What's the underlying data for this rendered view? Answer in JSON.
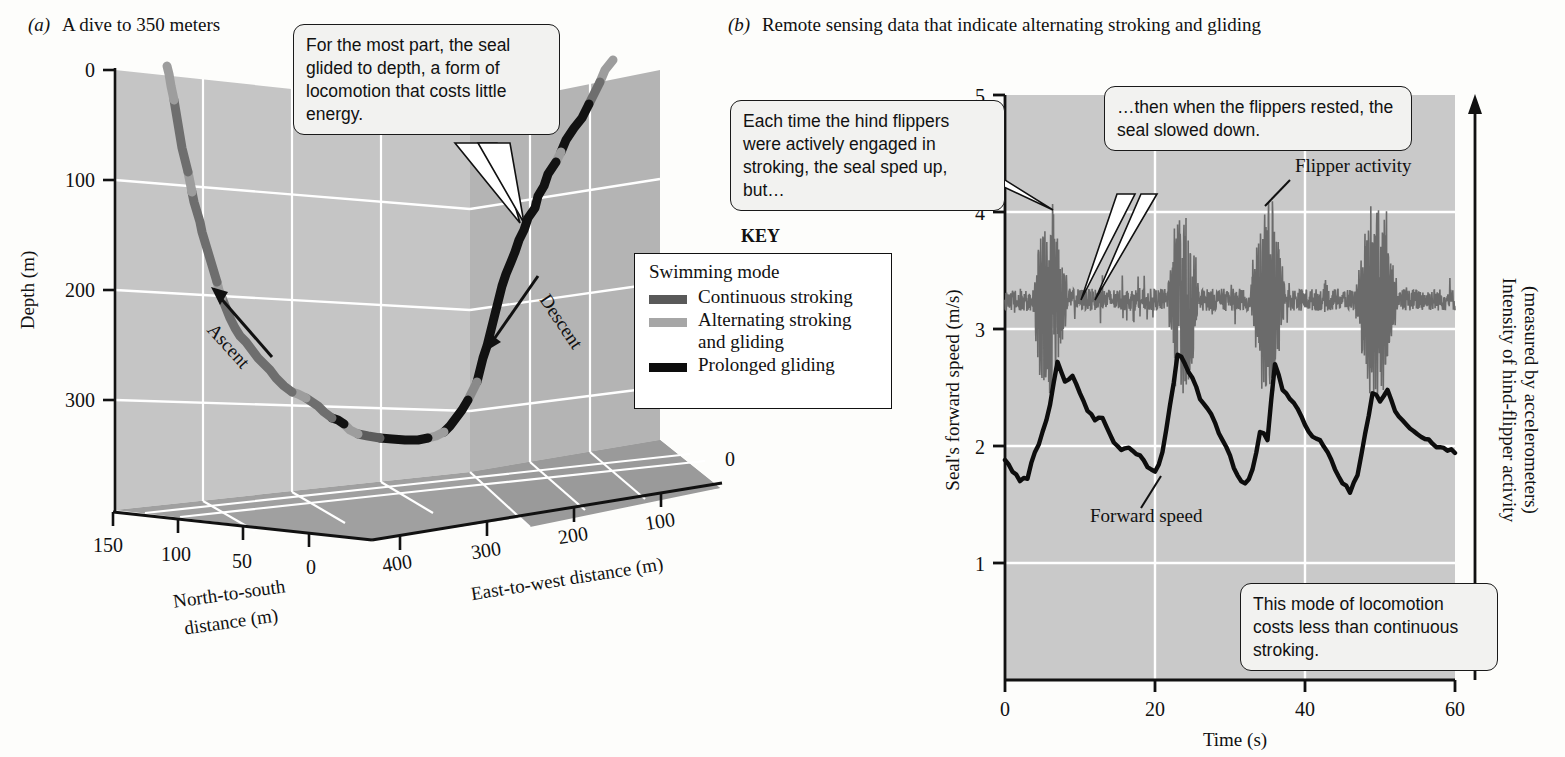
{
  "panels": {
    "a": {
      "letter": "(a)",
      "title": "A dive to 350 meters"
    },
    "b": {
      "letter": "(b)",
      "title": "Remote sensing data that indicate alternating stroking and gliding"
    }
  },
  "callouts": {
    "glide": "For the most part, the seal glided to depth, a form of locomotion that costs little energy.",
    "stroking": "Each time the hind flippers were actively engaged in stroking, the seal sped up, but…",
    "rested": "…then when the flippers rested, the seal slowed down.",
    "cheap": "This mode of locomotion costs less than continuous stroking."
  },
  "key": {
    "heading": "KEY",
    "subheading": "Swimming mode",
    "items": [
      {
        "label": "Continuous stroking",
        "color": "#595959"
      },
      {
        "label": "Alternating stroking and gliding",
        "color": "#a6a6a6"
      },
      {
        "label": "Prolonged gliding",
        "color": "#0d0d0d"
      }
    ]
  },
  "annotations": {
    "ascent": "Ascent",
    "descent": "Descent",
    "flipper_activity": "Flipper activity",
    "forward_speed": "Forward speed"
  },
  "colors": {
    "wall_back": "#c3c3c3",
    "wall_side": "#b3b3b3",
    "floor": "#9e9e9e",
    "plot_bg": "#c9c9c9",
    "grid": "#ffffff",
    "axis": "#111111",
    "speed_trace": "#0d0d0d",
    "flipper_trace": "#6b6b6b"
  },
  "chart_data": [
    {
      "type": "line",
      "id": "dive-profile-3d",
      "title": "A dive to 350 meters",
      "projection": "3d",
      "grid": true,
      "axes": {
        "depth": {
          "label": "Depth (m)",
          "ticks": [
            0,
            100,
            200,
            300
          ],
          "lim": [
            0,
            400
          ],
          "inverted": true
        },
        "north_south": {
          "label": "North-to-south distance (m)",
          "ticks": [
            150,
            100,
            50,
            0
          ],
          "lim": [
            0,
            150
          ]
        },
        "east_west": {
          "label": "East-to-west distance (m)",
          "ticks": [
            400,
            300,
            200,
            100,
            0
          ],
          "lim": [
            0,
            400
          ]
        }
      },
      "series": [
        {
          "name": "Descent",
          "mode_sequence": [
            "Alternating stroking and gliding",
            "Prolonged gliding",
            "Alternating stroking and gliding"
          ],
          "points": [
            {
              "depth": 25,
              "mode": "alternating"
            },
            {
              "depth": 45,
              "mode": "alternating"
            },
            {
              "depth": 70,
              "mode": "prolonged"
            },
            {
              "depth": 110,
              "mode": "prolonged"
            },
            {
              "depth": 150,
              "mode": "prolonged"
            },
            {
              "depth": 190,
              "mode": "prolonged"
            },
            {
              "depth": 230,
              "mode": "prolonged"
            },
            {
              "depth": 270,
              "mode": "prolonged"
            },
            {
              "depth": 300,
              "mode": "alternating"
            },
            {
              "depth": 320,
              "mode": "prolonged"
            }
          ]
        },
        {
          "name": "Bottom",
          "mode_sequence": [
            "Prolonged gliding",
            "Continuous stroking"
          ],
          "points": [
            {
              "depth": 325,
              "mode": "prolonged"
            },
            {
              "depth": 325,
              "mode": "continuous"
            },
            {
              "depth": 318,
              "mode": "alternating"
            }
          ]
        },
        {
          "name": "Ascent",
          "mode_sequence": [
            "Continuous stroking",
            "Alternating stroking and gliding"
          ],
          "points": [
            {
              "depth": 300,
              "mode": "continuous"
            },
            {
              "depth": 260,
              "mode": "continuous"
            },
            {
              "depth": 220,
              "mode": "continuous"
            },
            {
              "depth": 180,
              "mode": "continuous"
            },
            {
              "depth": 140,
              "mode": "continuous"
            },
            {
              "depth": 100,
              "mode": "continuous"
            },
            {
              "depth": 60,
              "mode": "continuous"
            },
            {
              "depth": 20,
              "mode": "alternating"
            },
            {
              "depth": 5,
              "mode": "alternating"
            }
          ]
        }
      ]
    },
    {
      "type": "line",
      "id": "speed-and-flipper-activity",
      "title": "Remote sensing data that indicate alternating stroking and gliding",
      "grid": true,
      "xlabel": "Time (s)",
      "ylabel": "Seal's forward speed (m/s)",
      "y2label": "Intensity of hind-flipper activity (measured by accelerometers)",
      "xlim": [
        0,
        60
      ],
      "ylim": [
        0,
        5
      ],
      "xticks": [
        0,
        20,
        40,
        60
      ],
      "yticks": [
        1,
        2,
        3,
        4,
        5
      ],
      "series": [
        {
          "name": "Flipper activity",
          "color": "#6b6b6b",
          "note": "baseline ~3.25 with bursts spanning ~2.6 to ~4.1",
          "burst_windows": [
            [
              3.5,
              8.5
            ],
            [
              21.5,
              26.0
            ],
            [
              32.5,
              37.5
            ],
            [
              46.5,
              52.5
            ]
          ],
          "baseline": 3.25,
          "burst_peak": 4.1,
          "burst_trough": 2.6
        },
        {
          "name": "Forward speed",
          "color": "#0d0d0d",
          "x": [
            0,
            1,
            2,
            3,
            4,
            5,
            6,
            7,
            8,
            9,
            10,
            11,
            12,
            13,
            14,
            15,
            16,
            17,
            18,
            19,
            20,
            21,
            22,
            23,
            24,
            25,
            26,
            27,
            28,
            29,
            30,
            31,
            32,
            33,
            34,
            35,
            36,
            37,
            38,
            39,
            40,
            41,
            42,
            43,
            44,
            45,
            46,
            47,
            48,
            49,
            50,
            51,
            52,
            53,
            54,
            55,
            56,
            57,
            58,
            59,
            60
          ],
          "y": [
            1.88,
            1.78,
            1.7,
            1.72,
            1.95,
            2.12,
            2.35,
            2.72,
            2.55,
            2.6,
            2.45,
            2.3,
            2.22,
            2.24,
            2.1,
            2.0,
            1.98,
            1.96,
            1.92,
            1.82,
            1.78,
            1.95,
            2.35,
            2.78,
            2.7,
            2.58,
            2.4,
            2.32,
            2.2,
            2.05,
            1.92,
            1.75,
            1.68,
            1.8,
            2.12,
            2.05,
            2.7,
            2.48,
            2.4,
            2.32,
            2.18,
            2.08,
            2.05,
            1.95,
            1.8,
            1.68,
            1.6,
            1.75,
            2.1,
            2.45,
            2.38,
            2.48,
            2.3,
            2.22,
            2.15,
            2.1,
            2.06,
            2.02,
            1.99,
            1.96,
            1.94
          ]
        }
      ]
    }
  ]
}
